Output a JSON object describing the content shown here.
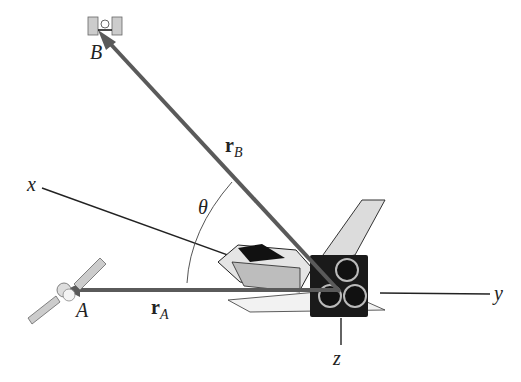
{
  "diagram": {
    "type": "3D position vector diagram",
    "axes": {
      "x": "x",
      "y": "y",
      "z": "z"
    },
    "points": {
      "A": "A",
      "B": "B"
    },
    "vectors": {
      "rA_main": "r",
      "rA_sub": "A",
      "rB_main": "r",
      "rB_sub": "B"
    },
    "angle": "θ",
    "objects": [
      "satellite A",
      "satellite B",
      "space shuttle at origin"
    ],
    "colors": {
      "vector": "#5a5a5a",
      "axis": "#222222",
      "shuttle_dark": "#1a1a1a",
      "shuttle_light": "#d8d8d8"
    }
  }
}
